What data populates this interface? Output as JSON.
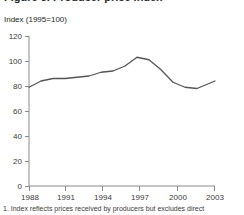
{
  "figure": {
    "title_partial": "Figure 3. Producer price index",
    "axis_note": "Index (1995=100)",
    "footnote": "1. Index reflects prices received by producers but excludes direct"
  },
  "chart_data": {
    "type": "line",
    "title": "",
    "subtitle": "Index (1995=100)",
    "xlabel": "",
    "ylabel": "Index (1995=100)",
    "xlim": [
      1988,
      2003.5
    ],
    "ylim": [
      0,
      120
    ],
    "yticks": [
      0,
      20,
      40,
      60,
      80,
      100,
      120
    ],
    "ytick_labels": [
      "0",
      "20",
      "40",
      "60",
      "80",
      "100",
      "120"
    ],
    "xticks": [
      1988,
      1991,
      1994,
      1997,
      2000,
      2003
    ],
    "xtick_labels": [
      "1988",
      "1991",
      "1994",
      "1997",
      "2000",
      "2003"
    ],
    "grid": false,
    "legend": "none",
    "line_color": "#555555",
    "series": [
      {
        "name": "Producer price index",
        "x": [
          1988,
          1989,
          1990,
          1991,
          1992,
          1993,
          1994,
          1995,
          1996,
          1997,
          1998,
          1999,
          2000,
          2001,
          2002,
          2003,
          2003.5
        ],
        "values": [
          79,
          84,
          86,
          86,
          87,
          88,
          91,
          92,
          96,
          103,
          101,
          93,
          83,
          79,
          78,
          82,
          84
        ]
      }
    ]
  }
}
